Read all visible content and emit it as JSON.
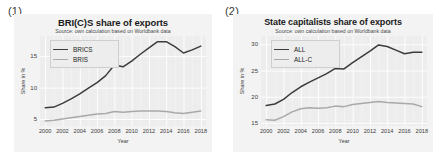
{
  "figure": {
    "panels": [
      {
        "tag": "(1)",
        "title": "BRI(C)S share of exports",
        "subtitle": "Source: own calculation based on Worldbank data",
        "xlabel": "Year",
        "ylabel": "Share in %"
      },
      {
        "tag": "(2)",
        "title": "State capitalists share of exports",
        "subtitle": "Source: own calculation based on Worldbank data",
        "xlabel": "Year",
        "ylabel": "Share in %"
      }
    ]
  },
  "colors": {
    "series_dark": "#3c3c3c",
    "series_light": "#a9a9a9",
    "plot_background": "#ededed",
    "figure_background": "#f3f3f3",
    "gridline": "#ffffff",
    "text": "#3d3d3d"
  },
  "chart_data": [
    {
      "type": "line",
      "title": "BRI(C)S share of exports",
      "subtitle": "Source: own calculation based on Worldbank data",
      "xlabel": "Year",
      "ylabel": "Share in %",
      "grid": true,
      "legend_position": "upper left",
      "xlim": [
        1999.4,
        2018.6
      ],
      "ylim": [
        3.9,
        18.2
      ],
      "xticks": [
        2000,
        2002,
        2004,
        2006,
        2008,
        2010,
        2012,
        2014,
        2016,
        2018
      ],
      "yticks": [
        5,
        10,
        15
      ],
      "x": [
        2000,
        2001,
        2002,
        2003,
        2004,
        2005,
        2006,
        2007,
        2008,
        2009,
        2010,
        2011,
        2012,
        2013,
        2014,
        2015,
        2016,
        2017,
        2018
      ],
      "series": [
        {
          "name": "BRICS",
          "color": "#3c3c3c",
          "values": [
            6.8,
            6.9,
            7.5,
            8.2,
            9.0,
            9.9,
            10.8,
            11.9,
            13.6,
            13.3,
            14.2,
            15.3,
            16.3,
            17.3,
            17.3,
            16.5,
            15.5,
            16.0,
            16.6
          ]
        },
        {
          "name": "BRIS",
          "color": "#a9a9a9",
          "values": [
            4.7,
            4.8,
            5.0,
            5.2,
            5.4,
            5.6,
            5.8,
            5.9,
            6.2,
            6.1,
            6.2,
            6.3,
            6.3,
            6.3,
            6.2,
            6.0,
            5.9,
            6.1,
            6.3
          ]
        }
      ]
    },
    {
      "type": "line",
      "title": "State capitalists share of exports",
      "subtitle": "Source: own calculation based on Worldbank data",
      "xlabel": "Year",
      "ylabel": "Share in %",
      "grid": true,
      "legend_position": "upper left",
      "xlim": [
        1999.4,
        2018.6
      ],
      "ylim": [
        14.4,
        31.6
      ],
      "xticks": [
        2000,
        2002,
        2004,
        2006,
        2008,
        2010,
        2012,
        2014,
        2016,
        2018
      ],
      "yticks": [
        15,
        20,
        25,
        30
      ],
      "x": [
        2000,
        2001,
        2002,
        2003,
        2004,
        2005,
        2006,
        2007,
        2008,
        2009,
        2010,
        2011,
        2012,
        2013,
        2014,
        2015,
        2016,
        2017,
        2018
      ],
      "series": [
        {
          "name": "ALL",
          "color": "#3c3c3c",
          "values": [
            18.3,
            18.6,
            19.5,
            20.8,
            21.9,
            22.8,
            23.6,
            24.4,
            25.4,
            25.3,
            26.5,
            27.6,
            28.7,
            29.9,
            29.6,
            28.9,
            28.2,
            28.5,
            28.5
          ]
        },
        {
          "name": "ALL-C",
          "color": "#a9a9a9",
          "values": [
            15.6,
            15.5,
            16.2,
            17.1,
            17.7,
            17.9,
            17.8,
            17.9,
            18.2,
            18.1,
            18.5,
            18.7,
            18.9,
            19.1,
            18.9,
            18.8,
            18.7,
            18.6,
            18.1
          ]
        }
      ]
    }
  ]
}
